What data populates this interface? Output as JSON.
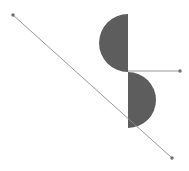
{
  "canvas": {
    "width": 189,
    "height": 171,
    "background_color": "#ffffff",
    "title": "Geometric Figure"
  },
  "palette": {
    "shape_fill": "#5d5d5d",
    "shape_fill_alt": "#606060",
    "line_stroke": "#8c8c8c",
    "point_marker": "#6e6e6e",
    "background": "#ffffff"
  },
  "shapes": [
    {
      "name": "upper-half-disc",
      "type": "semicircle",
      "label": "Upper half-disc",
      "center_x": 128,
      "center_y": 43,
      "radius": 29,
      "opens_toward": "left",
      "flat_edge": "vertical-right",
      "top_y": 14,
      "bottom_y": 72,
      "left_x": 99,
      "right_x": 128,
      "fill": "#5d5d5d"
    },
    {
      "name": "lower-half-disc",
      "type": "semicircle",
      "label": "Lower half-disc",
      "center_x": 128,
      "center_y": 100,
      "radius": 28,
      "opens_toward": "right",
      "flat_edge": "vertical-left",
      "top_y": 72,
      "bottom_y": 128,
      "left_x": 128,
      "right_x": 156,
      "fill": "#5d5d5d"
    }
  ],
  "segments": [
    {
      "name": "diagonal-segment",
      "label": "Diagonal segment",
      "x1": 13,
      "y1": 15,
      "x2": 172,
      "y2": 158,
      "stroke": "#8c8c8c",
      "stroke_width": 0.9,
      "endpoint_markers": 2
    },
    {
      "name": "horizontal-segment",
      "label": "Horizontal segment",
      "x1": 128,
      "y1": 71,
      "x2": 180,
      "y2": 71,
      "stroke": "#8c8c8c",
      "stroke_width": 0.9,
      "endpoint_markers": 1
    }
  ],
  "points": [
    {
      "name": "point-diagonal-start",
      "label": "A",
      "x": 13,
      "y": 15,
      "radius": 1.7,
      "color": "#6e6e6e"
    },
    {
      "name": "point-diagonal-end",
      "label": "B",
      "x": 172,
      "y": 158,
      "radius": 1.7,
      "color": "#6e6e6e"
    },
    {
      "name": "point-horizontal-end",
      "label": "C",
      "x": 180,
      "y": 71,
      "radius": 1.7,
      "color": "#6e6e6e"
    }
  ],
  "chart_data": {
    "type": "scatter",
    "title": "",
    "xlabel": "",
    "ylabel": "",
    "xlim": [
      0,
      189
    ],
    "ylim": [
      0,
      171
    ],
    "grid": false,
    "legend": "none",
    "annotations": [
      "Two gray half-discs joined at a common vertical chord line at x = 128",
      "Upper half-disc bulges left, lower half-disc bulges right",
      "A long thin diagonal segment runs from upper-left to lower-right with dot markers at both ends",
      "A short thin horizontal segment runs right from the half-disc junction with a dot marker at its right end"
    ]
  }
}
